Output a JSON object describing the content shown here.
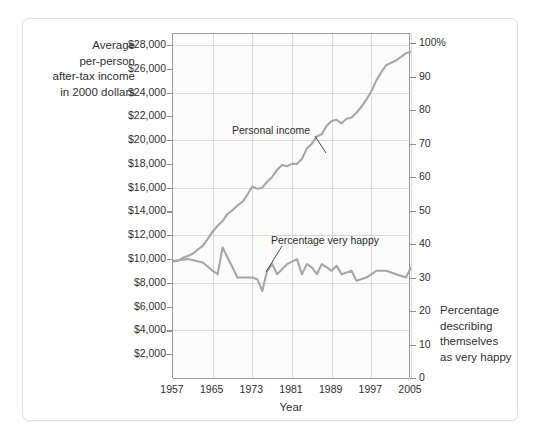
{
  "figure": {
    "y_left_title": "Average\nper-person\nafter-tax income\nin 2000 dollars",
    "y_right_title": "Percentage\ndescribing\nthemselves\nas very happy",
    "x_title": "Year"
  },
  "chart_data": {
    "type": "line",
    "title": "",
    "subtitle": "",
    "xlabel": "Year",
    "ylabel": "Average per-person after-tax income in 2000 dollars",
    "y2label": "Percentage describing themselves as very happy",
    "grid": true,
    "legend_position": "inline-annotation",
    "xlim": [
      1957,
      2005
    ],
    "x_ticks": [
      "1957",
      "1965",
      "1973",
      "1981",
      "1989",
      "1997",
      "2005"
    ],
    "x_tick_values": [
      1957,
      1965,
      1973,
      1981,
      1989,
      1997,
      2005
    ],
    "ylim": [
      0,
      29000
    ],
    "y_ticks": [
      "$2,000",
      "$4,000",
      "$6,000",
      "$8,000",
      "$10,000",
      "$12,000",
      "$14,000",
      "$16,000",
      "$18,000",
      "$20,000",
      "$22,000",
      "$24,000",
      "$26,000",
      "$28,000"
    ],
    "y_tick_values": [
      2000,
      4000,
      6000,
      8000,
      10000,
      12000,
      14000,
      16000,
      18000,
      20000,
      22000,
      24000,
      26000,
      28000
    ],
    "y2lim": [
      0,
      103
    ],
    "y2_ticks": [
      "0",
      "10",
      "20",
      "30",
      "40",
      "50",
      "60",
      "70",
      "80",
      "90",
      "100%"
    ],
    "y2_tick_values": [
      0,
      10,
      20,
      30,
      40,
      50,
      60,
      70,
      80,
      90,
      100
    ],
    "gridline_y_values": [
      4000,
      8000,
      12000,
      16000,
      20000,
      24000,
      28000
    ],
    "series": [
      {
        "name": "Personal income",
        "axis": "left",
        "color": "#a6a6a6",
        "x": [
          1957,
          1958,
          1959,
          1960,
          1961,
          1962,
          1963,
          1964,
          1965,
          1966,
          1967,
          1968,
          1969,
          1970,
          1971,
          1972,
          1973,
          1974,
          1975,
          1976,
          1977,
          1978,
          1979,
          1980,
          1981,
          1982,
          1983,
          1984,
          1985,
          1986,
          1987,
          1988,
          1989,
          1990,
          1991,
          1992,
          1993,
          1994,
          1995,
          1996,
          1997,
          1998,
          1999,
          2000,
          2001,
          2002,
          2003,
          2004,
          2005
        ],
        "values": [
          9800,
          9850,
          10100,
          10250,
          10450,
          10800,
          11100,
          11700,
          12300,
          12800,
          13200,
          13800,
          14100,
          14500,
          14800,
          15400,
          16100,
          15900,
          16000,
          16500,
          16900,
          17500,
          17900,
          17800,
          18000,
          18000,
          18400,
          19300,
          19700,
          20300,
          20500,
          21200,
          21600,
          21700,
          21400,
          21800,
          21900,
          22300,
          22800,
          23400,
          24100,
          25000,
          25700,
          26300,
          26500,
          26700,
          27000,
          27300,
          27400
        ]
      },
      {
        "name": "Percentage very happy",
        "axis": "right",
        "color": "#a6a6a6",
        "x": [
          1957,
          1960,
          1963,
          1965,
          1966,
          1967,
          1970,
          1971,
          1972,
          1973,
          1974,
          1975,
          1976,
          1977,
          1978,
          1980,
          1982,
          1983,
          1984,
          1985,
          1986,
          1987,
          1988,
          1989,
          1990,
          1991,
          1993,
          1994,
          1996,
          1998,
          2000,
          2002,
          2004,
          2005
        ],
        "values": [
          35,
          35.5,
          34.5,
          32,
          31,
          39,
          30,
          30,
          30,
          30,
          29.5,
          26,
          32,
          34,
          31,
          34,
          35.5,
          31,
          34,
          33,
          31,
          34,
          33,
          32,
          33.5,
          31,
          32,
          29,
          30,
          32,
          32,
          31,
          30,
          33
        ]
      }
    ],
    "annotations": [
      {
        "text": "Personal income",
        "x": 1979,
        "y": 21000
      },
      {
        "text": "Percentage very happy",
        "x": 1987,
        "y": 40
      }
    ]
  }
}
